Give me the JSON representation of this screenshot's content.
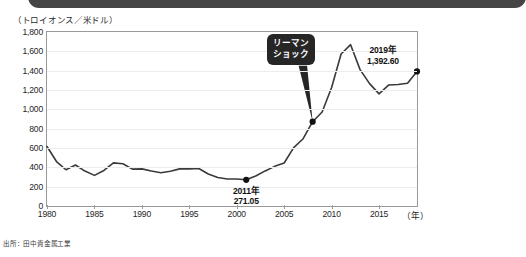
{
  "header": {
    "ribbon_color": "#454545"
  },
  "axis": {
    "unit_caption": "（トロイオンス／米ドル）",
    "x_unit_label": "（年）",
    "y_ticks": [
      "0",
      "200",
      "400",
      "600",
      "800",
      "1,000",
      "1,200",
      "1,400",
      "1,600",
      "1,800"
    ],
    "x_ticks": [
      "1980",
      "1985",
      "1990",
      "1995",
      "2000",
      "2005",
      "2010",
      "2015"
    ]
  },
  "annotations": {
    "lehman": {
      "line1": "リーマン",
      "line2": "ショック"
    },
    "low": {
      "year": "2011年",
      "value": "271.05"
    },
    "latest": {
      "year": "2019年",
      "value": "1,392.60"
    }
  },
  "source": {
    "text": "出所：田中貴金属工業"
  },
  "colors": {
    "line": "#3a3a3a",
    "callout_bg": "#262626",
    "grid": "#ececec",
    "border": "#9a9a9a"
  },
  "chart_data": {
    "type": "line",
    "title": "",
    "xlabel": "（年）",
    "ylabel": "（トロイオンス／米ドル）",
    "xlim": [
      1980,
      2019
    ],
    "ylim": [
      0,
      1800
    ],
    "grid": true,
    "legend": "none",
    "series": [
      {
        "name": "金価格（米ドル／トロイオンス）",
        "x": [
          1980,
          1981,
          1982,
          1983,
          1984,
          1985,
          1986,
          1987,
          1988,
          1989,
          1990,
          1991,
          1992,
          1993,
          1994,
          1995,
          1996,
          1997,
          1998,
          1999,
          2000,
          2001,
          2002,
          2003,
          2004,
          2005,
          2006,
          2007,
          2008,
          2009,
          2010,
          2011,
          2012,
          2013,
          2014,
          2015,
          2016,
          2017,
          2018,
          2019
        ],
        "y": [
          615,
          460,
          375,
          424,
          361,
          317,
          368,
          446,
          437,
          381,
          384,
          362,
          344,
          360,
          384,
          384,
          388,
          331,
          294,
          279,
          279,
          271,
          310,
          363,
          410,
          445,
          604,
          696,
          872,
          973,
          1225,
          1572,
          1669,
          1411,
          1266,
          1160,
          1251,
          1257,
          1269,
          1392.6
        ]
      }
    ],
    "markers": [
      {
        "label": "2011年\n271.05",
        "x": 2001,
        "y": 271.05
      },
      {
        "label": "リーマンショック",
        "x": 2008,
        "y": 872
      },
      {
        "label": "2019年\n1,392.60",
        "x": 2019,
        "y": 1392.6
      }
    ]
  }
}
